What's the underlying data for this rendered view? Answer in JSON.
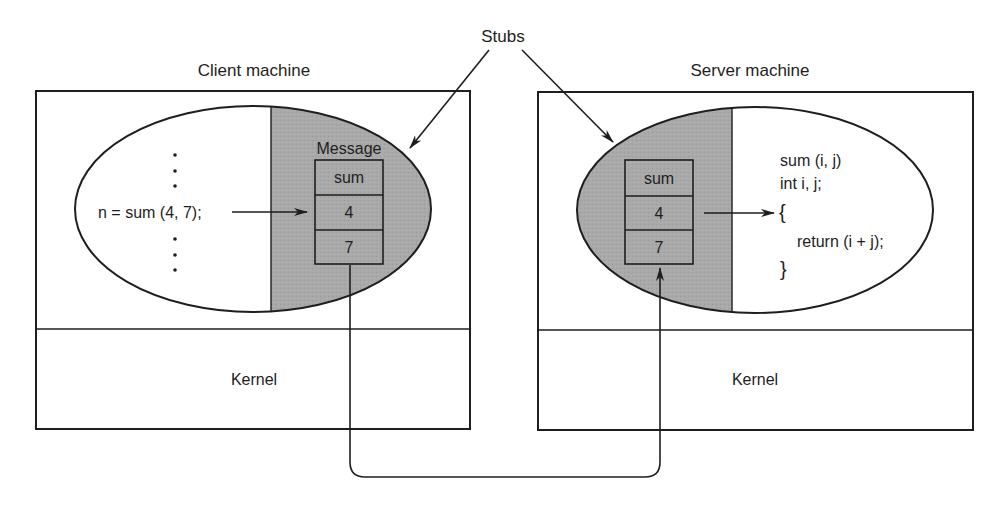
{
  "diagram": {
    "callout": {
      "label": "Stubs"
    },
    "colors": {
      "ink": "#1e1e1e",
      "stub_fill": "#a9a9a9",
      "background": "#ffffff"
    },
    "client": {
      "title": "Client machine",
      "kernel_label": "Kernel",
      "code_line": "n = sum (4, 7);",
      "ellipsis_dots": "⋮",
      "message_label": "Message",
      "message_cells": [
        "sum",
        "4",
        "7"
      ]
    },
    "server": {
      "title": "Server machine",
      "kernel_label": "Kernel",
      "message_cells": [
        "sum",
        "4",
        "7"
      ],
      "code_lines": [
        "sum (i, j)",
        "int i, j;",
        "{",
        "return (i + j);",
        "}"
      ]
    },
    "connections": [
      {
        "from": "client-code-line",
        "to": "client-message-cell-4",
        "type": "arrow"
      },
      {
        "from": "client-message",
        "to": "server-message",
        "type": "network-path-through-kernels"
      },
      {
        "from": "server-message-cell-4",
        "to": "server-code-open-brace",
        "type": "arrow"
      },
      {
        "from": "stubs-label",
        "to": "client-stub",
        "type": "pointer-arrow"
      },
      {
        "from": "stubs-label",
        "to": "server-stub",
        "type": "pointer-arrow"
      }
    ]
  }
}
